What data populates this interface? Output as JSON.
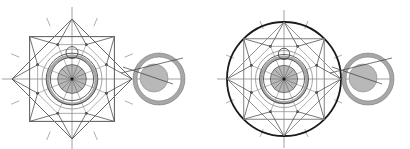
{
  "figures": [
    {
      "id": "left",
      "label": "star-construction",
      "center": [
        72,
        79
      ],
      "outline": "octagram",
      "outer_radius": 60,
      "has_bounding_circle": false
    },
    {
      "id": "right",
      "label": "circle-construction",
      "center": [
        284,
        79
      ],
      "outline": "circle",
      "outer_radius": 57,
      "has_bounding_circle": true
    }
  ],
  "colors": {
    "line": "#3a3a3a",
    "light_line": "#8a8a8a",
    "fill_gray": "#b8b8b8",
    "ring_gray": "#a8a8a8",
    "bold": "#1a1a1a"
  }
}
